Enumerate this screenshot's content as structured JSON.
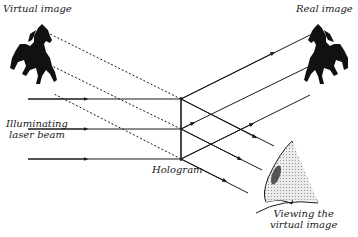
{
  "diagram": {
    "type": "hologram-reconstruction",
    "labels": {
      "virtual_image": "Virtual image",
      "real_image": "Real image",
      "laser_line1": "Illuminating",
      "laser_line2": "laser beam",
      "hologram": "Hologram",
      "viewing_line1": "Viewing the",
      "viewing_line2": "virtual image"
    },
    "colors": {
      "ink": "#1a1a1a",
      "eye_fill": "#d9d9d9",
      "pupil": "#555555",
      "background": "#ffffff"
    },
    "hologram": {
      "x": 181,
      "y_top": 99,
      "y_bottom": 159
    },
    "laser_beams": [
      {
        "y": 99,
        "x_start": 28
      },
      {
        "y": 129,
        "x_start": 28
      },
      {
        "y": 159,
        "x_start": 28
      }
    ],
    "nodes": [
      "Virtual image (horse)",
      "Illuminating laser beam",
      "Hologram",
      "Real image (horse)",
      "Viewing the virtual image (eye)"
    ],
    "edges": [
      {
        "from": "Illuminating laser beam",
        "to": "Hologram",
        "style": "solid-arrow"
      },
      {
        "from": "Hologram",
        "to": "Real image (horse)",
        "style": "solid-arrow"
      },
      {
        "from": "Hologram",
        "to": "Virtual image (horse)",
        "style": "dashed"
      },
      {
        "from": "Hologram",
        "to": "Viewing the virtual image (eye)",
        "style": "solid-arrow"
      }
    ]
  }
}
